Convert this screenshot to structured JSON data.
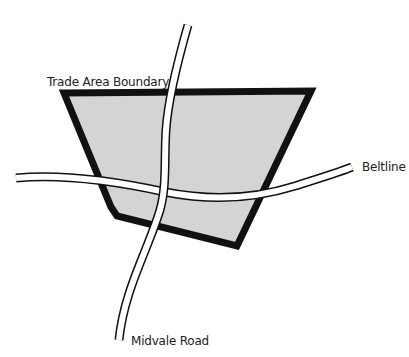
{
  "map": {
    "colors": {
      "boundary_fill": "#d4d4d4",
      "boundary_stroke": "#111111",
      "road_edge": "#111111",
      "road_fill": "#ffffff"
    },
    "labels": {
      "trade_area": "Trade Area Boundary",
      "beltline": "Beltline",
      "midvale": "Midvale Road"
    }
  }
}
